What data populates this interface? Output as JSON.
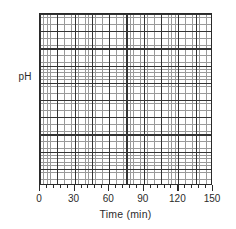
{
  "chart_data": {
    "type": "line",
    "title": "",
    "subtitle": "",
    "xlabel": "Time (min)",
    "ylabel": "pH",
    "xlim": [
      0,
      150
    ],
    "ylim": [
      null,
      null
    ],
    "xticks": [
      {
        "value": 0,
        "label": "0"
      },
      {
        "value": 30,
        "label": "30"
      },
      {
        "value": 60,
        "label": "60"
      },
      {
        "value": 90,
        "label": "90"
      },
      {
        "value": 120,
        "label": "120"
      },
      {
        "value": 150,
        "label": "150"
      }
    ],
    "yticks": [],
    "yticklabels": [],
    "series": [],
    "values": [],
    "categories": [],
    "annotations": [],
    "legend": {
      "entries": [],
      "position": "none",
      "visible": false
    },
    "grid": {
      "visible": true,
      "style": "graph-paper",
      "minor_divisions_per_major": 5,
      "major_columns": 10,
      "major_rows": 10,
      "minor_columns": 50,
      "minor_rows": 50,
      "minor_color": "#9a9a9a",
      "major_color": "#343434"
    },
    "axes": {
      "frame": true,
      "frame_color": "#2a2a2a",
      "tick_direction": "out",
      "x_minor_ticks": true,
      "y_ticklabels_shown": false
    }
  },
  "figure": {
    "background": "#ffffff",
    "text_color": "#2b2b2b"
  }
}
